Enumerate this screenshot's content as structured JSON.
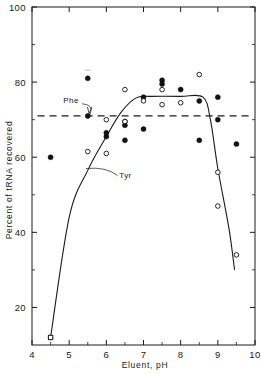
{
  "chart_data": {
    "type": "scatter",
    "title": "",
    "xlabel": "Eluent, pH",
    "ylabel": "Percent of tRNA recovered",
    "xlim": [
      4,
      10
    ],
    "ylim": [
      10,
      100
    ],
    "grid": false,
    "legend_position": "inline-annotations",
    "x_ticks": [
      "4",
      "5",
      "6",
      "7",
      "8",
      "9",
      "10"
    ],
    "x_tick_values": [
      4,
      5,
      6,
      7,
      8,
      9,
      10
    ],
    "x_minor_ticks": [
      4.5,
      5.5,
      6.5,
      7.5,
      8.5,
      9.5
    ],
    "y_ticks": [
      "20",
      "40",
      "60",
      "80",
      "100"
    ],
    "y_tick_values": [
      20,
      40,
      60,
      80,
      100
    ],
    "y_minor_ticks": [
      30,
      50,
      70,
      90
    ],
    "annotations": [
      {
        "label": "Phe",
        "target": "dashed-horizontal-line",
        "x": 5.05,
        "y": 74.5
      },
      {
        "label": "Tyr",
        "target": "solid-sigmoid-curve",
        "x": 6.35,
        "y": 54.5
      }
    ],
    "series": [
      {
        "name": "Phe",
        "marker": "filled-circle",
        "line": "dashed",
        "line_level": 71,
        "points": [
          {
            "x": 4.5,
            "y": 60.0
          },
          {
            "x": 5.5,
            "y": 81.0
          },
          {
            "x": 5.5,
            "y": 71.0
          },
          {
            "x": 6.0,
            "y": 66.5
          },
          {
            "x": 6.0,
            "y": 65.5
          },
          {
            "x": 6.5,
            "y": 69.5
          },
          {
            "x": 6.5,
            "y": 68.5
          },
          {
            "x": 6.5,
            "y": 64.5
          },
          {
            "x": 7.0,
            "y": 76.0
          },
          {
            "x": 7.0,
            "y": 67.5
          },
          {
            "x": 7.5,
            "y": 80.5
          },
          {
            "x": 7.5,
            "y": 79.5
          },
          {
            "x": 8.0,
            "y": 78.0
          },
          {
            "x": 8.5,
            "y": 75.0
          },
          {
            "x": 8.5,
            "y": 64.5
          },
          {
            "x": 9.0,
            "y": 76.0
          },
          {
            "x": 9.0,
            "y": 70.0
          },
          {
            "x": 9.5,
            "y": 63.5
          }
        ]
      },
      {
        "name": "Tyr",
        "marker": "open-circle",
        "line": "solid",
        "points": [
          {
            "x": 4.5,
            "y": 12.0
          },
          {
            "x": 5.5,
            "y": 61.5
          },
          {
            "x": 6.0,
            "y": 70.0
          },
          {
            "x": 6.0,
            "y": 61.0
          },
          {
            "x": 6.5,
            "y": 78.0
          },
          {
            "x": 6.5,
            "y": 69.5
          },
          {
            "x": 7.0,
            "y": 75.0
          },
          {
            "x": 7.5,
            "y": 78.0
          },
          {
            "x": 7.5,
            "y": 74.0
          },
          {
            "x": 8.0,
            "y": 74.5
          },
          {
            "x": 8.5,
            "y": 82.0
          },
          {
            "x": 9.0,
            "y": 56.0
          },
          {
            "x": 9.0,
            "y": 47.0
          },
          {
            "x": 9.5,
            "y": 34.0
          }
        ]
      }
    ],
    "fit_curves": [
      {
        "name": "Tyr",
        "style": "solid",
        "path_points": [
          {
            "x": 4.5,
            "y": 12.0
          },
          {
            "x": 5.0,
            "y": 44.0
          },
          {
            "x": 5.5,
            "y": 56.5
          },
          {
            "x": 6.0,
            "y": 65.5
          },
          {
            "x": 6.4,
            "y": 72.0
          },
          {
            "x": 6.8,
            "y": 75.8
          },
          {
            "x": 7.2,
            "y": 76.2
          },
          {
            "x": 8.0,
            "y": 76.2
          },
          {
            "x": 8.6,
            "y": 76.0
          },
          {
            "x": 8.8,
            "y": 70.0
          },
          {
            "x": 9.0,
            "y": 57.0
          },
          {
            "x": 9.3,
            "y": 41.0
          },
          {
            "x": 9.45,
            "y": 30.0
          }
        ]
      },
      {
        "name": "Phe",
        "style": "dashed",
        "level": 71,
        "x_from": 4.15,
        "x_to": 9.85
      }
    ]
  }
}
